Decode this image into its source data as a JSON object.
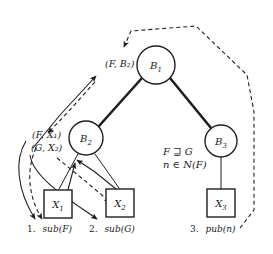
{
  "figure": {
    "background_color": "#ffffff",
    "stroke_color": "#1f1f1f"
  },
  "nodes": {
    "brokers": [
      {
        "id": "B1",
        "base": "B",
        "sub": "1",
        "cx": 156,
        "cy": 65,
        "r": 19
      },
      {
        "id": "B2",
        "base": "B",
        "sub": "2",
        "cx": 86,
        "cy": 138,
        "r": 17
      },
      {
        "id": "B3",
        "base": "B",
        "sub": "3",
        "cx": 221,
        "cy": 141,
        "r": 16
      }
    ],
    "clients": [
      {
        "id": "X1",
        "base": "X",
        "sub": "1",
        "x": 44,
        "y": 190,
        "w": 28,
        "h": 28
      },
      {
        "id": "X2",
        "base": "X",
        "sub": "2",
        "x": 106,
        "y": 189,
        "w": 28,
        "h": 28
      },
      {
        "id": "X3",
        "base": "X",
        "sub": "3",
        "x": 207,
        "y": 189,
        "w": 28,
        "h": 28
      }
    ]
  },
  "edge_labels": [
    {
      "id": "label-F-B2",
      "text": "(F, B₂)",
      "x": 105,
      "y": 67
    },
    {
      "id": "label-F-X1",
      "text": "(F, X₁)",
      "x": 32,
      "y": 138
    },
    {
      "id": "label-G-X2",
      "text": "(G, X₂)",
      "x": 31,
      "y": 151
    }
  ],
  "conditions": {
    "line1": "F ⊒ G",
    "line2": "n ∈ N(F)",
    "x": 163,
    "y1": 155,
    "y2": 168
  },
  "captions": [
    {
      "id": "caption-sub-F",
      "number": "1.",
      "call": "sub(F)",
      "x": 27,
      "y": 232
    },
    {
      "id": "caption-sub-G",
      "number": "2.",
      "call": "sub(G)",
      "x": 89,
      "y": 232
    },
    {
      "id": "caption-pub-n",
      "number": "3.",
      "call": "pub(n)",
      "x": 190,
      "y": 232
    }
  ],
  "legend": {
    "solid_meaning": "subscription propagation",
    "dashed_meaning": "publication / notification delivery"
  }
}
